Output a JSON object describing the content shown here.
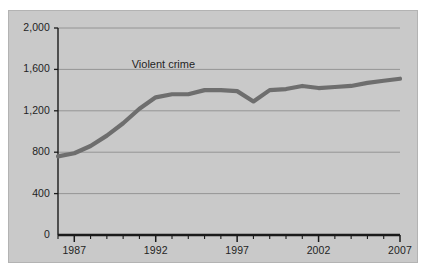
{
  "figure": {
    "background_color": "#ffffff",
    "panel_color": "#c9c9c9",
    "panel_border_color": "#b3b3b3"
  },
  "chart_data": {
    "type": "line",
    "title": "",
    "subtitle": "",
    "xlabel": "",
    "ylabel": "",
    "xlim": [
      1986,
      2007
    ],
    "ylim": [
      0,
      2000
    ],
    "grid": true,
    "grid_axis": "y",
    "legend_position": "inline-annotation",
    "series_color": "#6e6e6e",
    "axis_color": "#1a1a1a",
    "gridline_color": "#8f8f8f",
    "y_ticks": [
      0,
      400,
      800,
      1200,
      1600,
      2000
    ],
    "y_tick_labels": [
      "0",
      "400",
      "800",
      "1,200",
      "1,600",
      "2,000"
    ],
    "x_ticks": [
      1986,
      1987,
      1988,
      1989,
      1990,
      1991,
      1992,
      1993,
      1994,
      1995,
      1996,
      1997,
      1998,
      1999,
      2000,
      2001,
      2002,
      2003,
      2004,
      2005,
      2006,
      2007
    ],
    "x_tick_labels": [
      "1987",
      "1992",
      "1997",
      "2002",
      "2007"
    ],
    "x_labeled_years": [
      1987,
      1992,
      1997,
      2002,
      2007
    ],
    "annotations": [
      {
        "text": "Violent crime",
        "x": 1992,
        "y": 1640
      }
    ],
    "series": [
      {
        "name": "Violent crime",
        "color": "#6e6e6e",
        "x": [
          1986,
          1987,
          1988,
          1989,
          1990,
          1991,
          1992,
          1993,
          1994,
          1995,
          1996,
          1997,
          1998,
          1999,
          2000,
          2001,
          2002,
          2003,
          2004,
          2005,
          2006,
          2007
        ],
        "values": [
          760,
          790,
          860,
          960,
          1080,
          1220,
          1330,
          1360,
          1360,
          1400,
          1400,
          1390,
          1290,
          1400,
          1410,
          1440,
          1420,
          1430,
          1440,
          1470,
          1490,
          1510
        ]
      }
    ]
  }
}
